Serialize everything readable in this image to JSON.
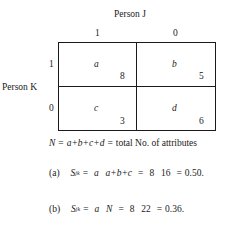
{
  "figure": {
    "col_header": "Person  J",
    "row_header": "Person  K",
    "col_labels": [
      "1",
      "0"
    ],
    "row_labels": [
      "1",
      "0"
    ],
    "cells": [
      {
        "symbol": "a",
        "value": "8"
      },
      {
        "symbol": "b",
        "value": "5"
      },
      {
        "symbol": "c",
        "value": "3"
      },
      {
        "symbol": "d",
        "value": "6"
      }
    ]
  },
  "definition": {
    "lhs": "N",
    "eq1": "=",
    "sum": "a+b+c+d",
    "eq2": "=",
    "text": "total No. of attributes"
  },
  "formula_a": {
    "label": "(a)",
    "S": "S",
    "sub": "jk",
    "eq1": "=",
    "num1": "a",
    "den1": "a+b+c",
    "eq2": "=",
    "num2": "8",
    "den2": "16",
    "eq3": "=",
    "result": "0.50."
  },
  "formula_b": {
    "label": "(b)",
    "S": "S",
    "sub": "jk",
    "eq1": "=",
    "num1": "a",
    "den1": "N",
    "eq2": "=",
    "num2": "8",
    "den2": "22",
    "eq3": "=",
    "result": "0.36."
  }
}
